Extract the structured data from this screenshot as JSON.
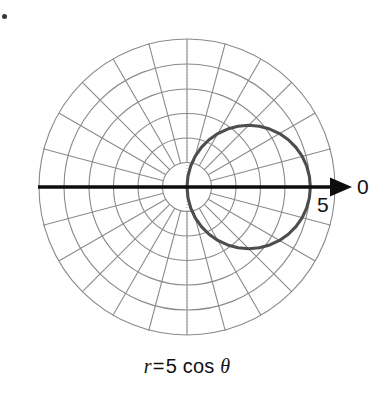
{
  "figure": {
    "title": "",
    "axis_label_polar_axis": "0",
    "axis_label_radius_mark": "5",
    "caption_r": "r",
    "caption_equals": "=",
    "caption_value": "5 cos",
    "caption_theta": "θ",
    "caption_full": "r = 5 cos θ"
  },
  "colors": {
    "grid": "#8a8a8a",
    "grid_dotted": "#9a9a9a",
    "curve": "#4d4d4d",
    "axis": "#0d0d0d",
    "text": "#111111",
    "background": "#ffffff"
  },
  "chart_data": {
    "type": "line",
    "plot_system": "polar",
    "title": "",
    "equation": "r = 5 cos θ",
    "xlabel": "",
    "ylabel": "",
    "legend": [],
    "grid": true,
    "polar_grid": {
      "radial_circles": 6,
      "radial_tick_values": [
        1,
        2,
        3,
        4,
        5,
        6
      ],
      "angular_spokes": 24,
      "angular_step_degrees": 15,
      "angular_tick_labels": [
        "0"
      ],
      "rlim": [
        0,
        6
      ],
      "spokes_start_radius_value": 1
    },
    "annotations": [
      {
        "text": "0",
        "meaning": "polar axis direction (theta = 0)",
        "position": "right of axis arrow"
      },
      {
        "text": "5",
        "meaning": "radius value at curve maximum",
        "position": "below polar axis at r = 5"
      }
    ],
    "series": [
      {
        "name": "r = 5 cos θ",
        "color": "#4d4d4d",
        "theta_degrees": [
          -90,
          -85,
          -80,
          -75,
          -70,
          -65,
          -60,
          -55,
          -50,
          -45,
          -40,
          -35,
          -30,
          -25,
          -20,
          -15,
          -10,
          -5,
          0,
          5,
          10,
          15,
          20,
          25,
          30,
          35,
          40,
          45,
          50,
          55,
          60,
          65,
          70,
          75,
          80,
          85,
          90
        ],
        "r_values": [
          0,
          0.436,
          0.868,
          1.294,
          1.71,
          2.113,
          2.5,
          2.868,
          3.214,
          3.536,
          3.83,
          4.096,
          4.33,
          4.532,
          4.699,
          4.83,
          4.924,
          4.981,
          5,
          4.981,
          4.924,
          4.83,
          4.699,
          4.532,
          4.33,
          4.096,
          3.83,
          3.536,
          3.214,
          2.868,
          2.5,
          2.113,
          1.71,
          1.294,
          0.868,
          0.436,
          0
        ],
        "shape": "circle",
        "circle_center_polar": [
          2.5,
          0
        ],
        "circle_radius": 2.5,
        "max_r": 5,
        "passes_through_pole": true
      }
    ]
  }
}
